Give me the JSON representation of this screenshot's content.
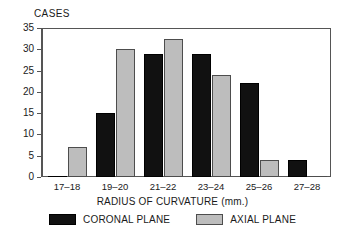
{
  "chart_data": {
    "type": "bar",
    "title": "",
    "ylabel": "CASES",
    "xlabel": "RADIUS OF CURVATURE (mm.)",
    "categories": [
      "17–18",
      "19–20",
      "21–22",
      "23–24",
      "25–26",
      "27–28"
    ],
    "series": [
      {
        "name": "CORONAL PLANE",
        "color": "#111111",
        "values": [
          0,
          15,
          29,
          29,
          22,
          4
        ]
      },
      {
        "name": "AXIAL PLANE",
        "color": "#bdbdbd",
        "values": [
          7,
          30,
          32.5,
          24,
          4,
          0
        ]
      }
    ],
    "ylim": [
      0,
      35
    ],
    "yticks": [
      0,
      5,
      10,
      15,
      20,
      25,
      30,
      35
    ],
    "ytick_labels": [
      "0",
      "5",
      "10",
      "15",
      "20",
      "25",
      "30",
      "35"
    ],
    "grid": false,
    "legend_position": "bottom"
  },
  "legend": {
    "entries": [
      {
        "label": "CORONAL PLANE"
      },
      {
        "label": "AXIAL PLANE"
      }
    ]
  }
}
